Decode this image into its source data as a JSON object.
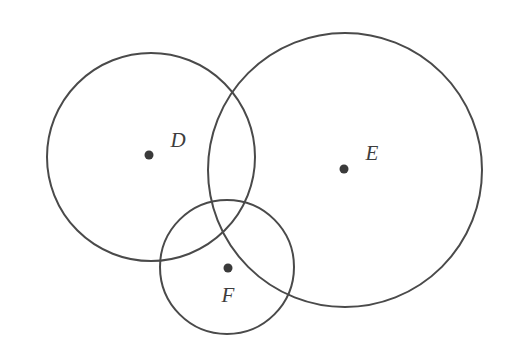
{
  "figure": {
    "background_color": "#ffffff",
    "stroke_color": "#4a4a4a",
    "label_color": "#3d3d3d",
    "dot_color": "#3a3a3a",
    "stroke_width": 2,
    "dot_radius": 4.5,
    "width": 506,
    "height": 364
  },
  "chart_data": {
    "type": "diagram",
    "subtype": "venn-circles",
    "units": "pixels",
    "circles": [
      {
        "id": "D",
        "label": "D",
        "center_x": 151,
        "center_y": 157,
        "radius": 104,
        "dot_x": 149,
        "dot_y": 155,
        "label_x": 178,
        "label_y": 142
      },
      {
        "id": "E",
        "label": "E",
        "center_x": 345,
        "center_y": 170,
        "radius": 137,
        "dot_x": 344,
        "dot_y": 169,
        "label_x": 372,
        "label_y": 155
      },
      {
        "id": "F",
        "label": "F",
        "center_x": 227,
        "center_y": 267,
        "radius": 67,
        "dot_x": 228,
        "dot_y": 268,
        "label_x": 228,
        "label_y": 297
      }
    ],
    "overlaps": [
      {
        "pair": "D-E",
        "description": "lens-shaped intersection"
      },
      {
        "pair": "D-F",
        "description": "lens-shaped intersection"
      },
      {
        "pair": "E-F",
        "description": "lens-shaped intersection"
      }
    ]
  }
}
